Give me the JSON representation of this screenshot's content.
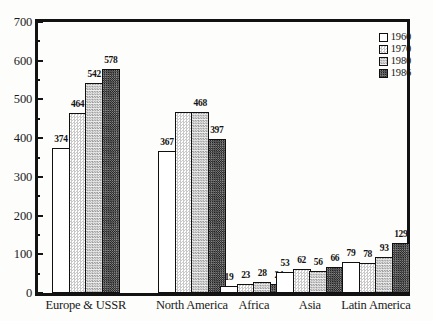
{
  "chart_data": {
    "type": "bar",
    "title": "",
    "subtitle": "",
    "xlabel": "",
    "ylabel": "",
    "ylim": [
      0,
      700
    ],
    "y_major_ticks": [
      0,
      100,
      200,
      300,
      400,
      500,
      600,
      700
    ],
    "y_minor_tick_interval": 50,
    "grid": false,
    "legend_position": "top-right",
    "categories": [
      "Europe & USSR",
      "North America",
      "Africa",
      "Asia",
      "Latin America"
    ],
    "series": [
      {
        "name": "1960",
        "values": [
          374,
          367,
          19,
          53,
          79
        ]
      },
      {
        "name": "1970",
        "values": [
          464,
          468,
          23,
          62,
          78
        ]
      },
      {
        "name": "1980",
        "values": [
          542,
          468,
          28,
          56,
          93
        ]
      },
      {
        "name": "1986",
        "values": [
          578,
          397,
          24,
          66,
          129
        ]
      }
    ],
    "bar_labels": {
      "Europe & USSR": [
        "374",
        "464",
        "542",
        "578"
      ],
      "North America": [
        "367",
        "",
        "468",
        "397"
      ],
      "Africa": [
        "19",
        "23",
        "28",
        "24"
      ],
      "Asia": [
        "53",
        "62",
        "56",
        "66"
      ],
      "Latin America": [
        "79",
        "78",
        "93",
        "129"
      ]
    }
  },
  "legend": {
    "items": [
      {
        "label": "1960",
        "pattern": "blank-white"
      },
      {
        "label": "1970",
        "pattern": "light-stipple"
      },
      {
        "label": "1980",
        "pattern": "medium-stipple"
      },
      {
        "label": "1986",
        "pattern": "dark-checker"
      }
    ]
  },
  "axis": {
    "y_tick_labels": [
      "700",
      "600",
      "500",
      "400",
      "300",
      "200",
      "100",
      "0"
    ]
  }
}
